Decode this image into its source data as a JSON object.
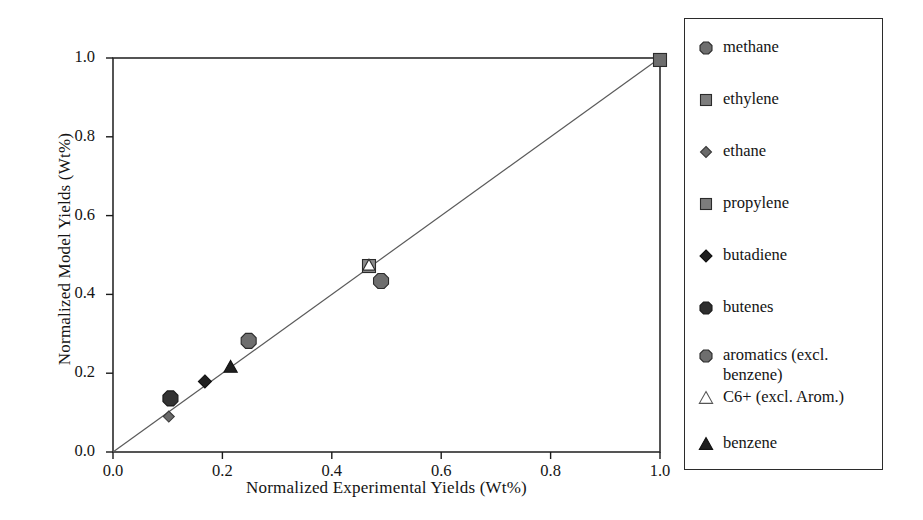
{
  "chart_data": {
    "type": "scatter",
    "title": "",
    "xlabel": "Normalized  Experimental  Yields (Wt%)",
    "ylabel": "Normalized Model Yields (Wt%)",
    "xlim": [
      0.0,
      1.0
    ],
    "ylim": [
      0.0,
      1.0
    ],
    "xticks": [
      "0.0",
      "0.2",
      "0.4",
      "0.6",
      "0.8",
      "1.0"
    ],
    "yticks": [
      "0.0",
      "0.2",
      "0.4",
      "0.6",
      "0.8",
      "1.0"
    ],
    "xtick_values": [
      0.0,
      0.2,
      0.4,
      0.6,
      0.8,
      1.0
    ],
    "ytick_values": [
      0.0,
      0.2,
      0.4,
      0.6,
      0.8,
      1.0
    ],
    "grid": false,
    "legend_position": "right-outside",
    "reference_line": {
      "name": "parity-line",
      "from": [
        0.0,
        0.0
      ],
      "to": [
        1.0,
        1.0
      ],
      "color": "#5a5a5a"
    },
    "series": [
      {
        "name": "methane",
        "marker": "octagon",
        "fill": "#6e6e6e",
        "edge": "#2b2b2b",
        "size": 15,
        "x": [
          0.49
        ],
        "y": [
          0.434
        ]
      },
      {
        "name": "ethylene",
        "marker": "square",
        "fill": "#6e6e6e",
        "edge": "#2b2b2b",
        "size": 13,
        "x": [
          1.0
        ],
        "y": [
          0.995
        ]
      },
      {
        "name": "ethane",
        "marker": "diamond",
        "fill": "#6a6a6a",
        "edge": "#3a3a3a",
        "size": 11,
        "x": [
          0.102
        ],
        "y": [
          0.09
        ]
      },
      {
        "name": "propylene",
        "marker": "square",
        "fill": "#8a8a8a",
        "edge": "#2b2b2b",
        "size": 13,
        "x": [
          0.468
        ],
        "y": [
          0.472
        ]
      },
      {
        "name": "butadiene",
        "marker": "diamond",
        "fill": "#1f1f1f",
        "edge": "#111111",
        "size": 13,
        "x": [
          0.168
        ],
        "y": [
          0.179
        ]
      },
      {
        "name": "butenes",
        "marker": "octagon",
        "fill": "#333333",
        "edge": "#1a1a1a",
        "size": 15,
        "x": [
          0.105
        ],
        "y": [
          0.136
        ]
      },
      {
        "name": "aromatics (excl. benzene)",
        "marker": "octagon",
        "fill": "#6e6e6e",
        "edge": "#2b2b2b",
        "size": 15,
        "x": [
          0.248
        ],
        "y": [
          0.282
        ]
      },
      {
        "name": "C6+ (excl. Arom.)",
        "marker": "open-triangle",
        "fill": "#ffffff",
        "edge": "#2b2b2b",
        "size": 12,
        "x": [
          0.468
        ],
        "y": [
          0.474
        ]
      },
      {
        "name": "benzene",
        "marker": "triangle",
        "fill": "#1f1f1f",
        "edge": "#111111",
        "size": 13,
        "x": [
          0.215
        ],
        "y": [
          0.216
        ]
      }
    ]
  },
  "legend": {
    "entries": [
      {
        "label": "methane",
        "marker": "octagon"
      },
      {
        "label": "ethylene",
        "marker": "square"
      },
      {
        "label": "ethane",
        "marker": "diamond"
      },
      {
        "label": "propylene",
        "marker": "square"
      },
      {
        "label": "butadiene",
        "marker": "diamond-filled"
      },
      {
        "label": "butenes",
        "marker": "octagon-dark"
      },
      {
        "label": "aromatics (excl. benzene)",
        "marker": "octagon"
      },
      {
        "label": "C6+ (excl. Arom.)",
        "marker": "open-triangle"
      },
      {
        "label": "benzene",
        "marker": "triangle-filled"
      }
    ]
  },
  "colors": {
    "axis": "#1a1a1a",
    "line": "#5a5a5a",
    "marker_gray": "#6e6e6e",
    "marker_dark": "#1f1f1f",
    "frame": "#2b2b2b",
    "background": "#ffffff"
  }
}
